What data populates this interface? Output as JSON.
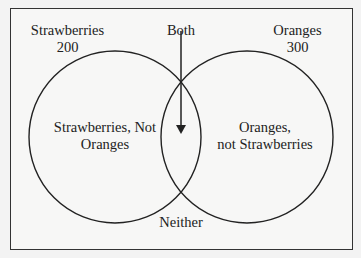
{
  "diagram": {
    "type": "venn",
    "sets": [
      {
        "name": "Strawberries",
        "count": "200"
      },
      {
        "name": "Oranges",
        "count": "300"
      }
    ],
    "labels": {
      "strawberries_title": "Strawberries",
      "strawberries_count": "200",
      "oranges_title": "Oranges",
      "oranges_count": "300",
      "both": "Both",
      "left_only_line1": "Strawberries, Not",
      "left_only_line2": "Oranges",
      "right_only_line1": "Oranges,",
      "right_only_line2": "not Strawberries",
      "neither": "Neither"
    }
  }
}
